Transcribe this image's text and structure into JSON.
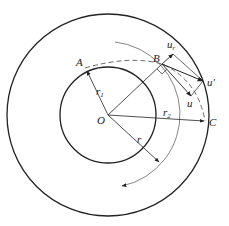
{
  "diagram": {
    "type": "velocity-triangle-impeller",
    "colors": {
      "stroke": "#222222",
      "thin": "#555555",
      "background": "#ffffff"
    },
    "points": {
      "O": {
        "label": "O",
        "x": 108,
        "y": 115
      },
      "A": {
        "label": "A",
        "x": 84,
        "y": 67
      },
      "B": {
        "label": "B",
        "x": 162,
        "y": 64
      },
      "C": {
        "label": "C",
        "x": 205,
        "y": 121
      }
    },
    "circles": [
      {
        "name": "outer",
        "cx": 108,
        "cy": 115,
        "r": 101
      },
      {
        "name": "inner",
        "cx": 108,
        "cy": 115,
        "r": 48
      }
    ],
    "radii_labels": {
      "r1": "r",
      "r1_sub": "1",
      "r2": "r",
      "r2_sub": "2",
      "r": "r"
    },
    "vectors": {
      "ur": "u",
      "ur_sub": "r",
      "u_prime": "u'",
      "u": "u"
    }
  }
}
